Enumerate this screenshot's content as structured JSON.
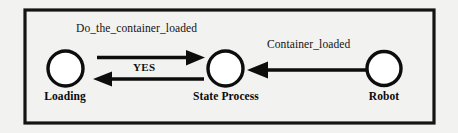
{
  "diagram": {
    "border": {
      "color": "#111111"
    },
    "nodes": [
      {
        "id": "loading",
        "label": "Loading",
        "shape": "circle",
        "cx": 65.5,
        "cy": 68.5,
        "r": 17.5
      },
      {
        "id": "state_process",
        "label": "State Process",
        "shape": "circle",
        "cx": 225.5,
        "cy": 68.5,
        "r": 17.5
      },
      {
        "id": "robot",
        "label": "Robot",
        "shape": "circle",
        "cx": 384,
        "cy": 68.5,
        "r": 17
      }
    ],
    "edges": [
      {
        "id": "loading-to-state-process",
        "label": "Do_the_container_loaded",
        "from": "loading",
        "to": "state_process",
        "direction": "right",
        "label_style": "regular"
      },
      {
        "id": "state-process-to-loading",
        "label": "YES",
        "from": "state_process",
        "to": "loading",
        "direction": "left",
        "label_style": "bold"
      },
      {
        "id": "robot-to-state-process",
        "label": "Container_loaded",
        "from": "robot",
        "to": "state_process",
        "direction": "left",
        "label_style": "regular"
      }
    ],
    "colors": {
      "stroke": "#0d0d0d",
      "background": "#f2f2f0",
      "node_fill": "#ffffff"
    }
  }
}
